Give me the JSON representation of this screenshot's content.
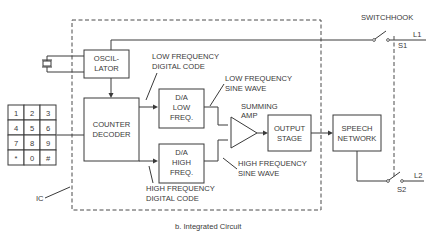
{
  "diagram": {
    "caption": "b. Integrated Circuit",
    "ic_label": "IC",
    "switchhook_label": "SWITCHHOOK",
    "blocks": {
      "oscillator": [
        "OSCIL-",
        "LATOR"
      ],
      "counter_decoder": [
        "COUNTER",
        "DECODER"
      ],
      "da_low": [
        "D/A",
        "LOW",
        "FREQ."
      ],
      "da_high": [
        "D/A",
        "HIGH",
        "FREQ."
      ],
      "output_stage": [
        "OUTPUT",
        "STAGE"
      ],
      "speech_network": [
        "SPEECH",
        "NETWORK"
      ]
    },
    "labels": {
      "low_freq_digital": [
        "LOW FREQUENCY",
        "DIGITAL CODE"
      ],
      "low_freq_sine": [
        "LOW FREQUENCY",
        "SINE WAVE"
      ],
      "summing_amp": [
        "SUMMING",
        "AMP"
      ],
      "high_freq_sine": [
        "HIGH FREQUENCY",
        "SINE WAVE"
      ],
      "high_freq_digital": [
        "HIGH FREQUENCY",
        "DIGITAL CODE"
      ]
    },
    "switches": {
      "s1": "S1",
      "s2": "S2",
      "l1": "L1",
      "l2": "L2"
    },
    "keypad": [
      "1",
      "2",
      "3",
      "4",
      "5",
      "6",
      "7",
      "8",
      "9",
      "*",
      "0",
      "#"
    ]
  }
}
